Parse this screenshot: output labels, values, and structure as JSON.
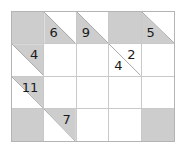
{
  "puzzle": {
    "type": "kakuro",
    "rows": 4,
    "cols": 5,
    "colors": {
      "clue_fill": "#cdcdcd",
      "entry_fill": "#ffffff",
      "grid_line": "#c9c9c9",
      "border": "#b4b4b4",
      "diagonal": "#a9a9a9",
      "numeral": "#1a1a1a"
    },
    "cells": [
      [
        {
          "kind": "block",
          "across": "",
          "down": ""
        },
        {
          "kind": "clue",
          "across": "",
          "down": "6"
        },
        {
          "kind": "clue",
          "across": "",
          "down": "9"
        },
        {
          "kind": "block",
          "across": "",
          "down": ""
        },
        {
          "kind": "clue",
          "across": "",
          "down": "5"
        }
      ],
      [
        {
          "kind": "clue",
          "across": "4",
          "down": ""
        },
        {
          "kind": "entry",
          "across": "",
          "down": ""
        },
        {
          "kind": "entry",
          "across": "",
          "down": ""
        },
        {
          "kind": "clue",
          "across": "2",
          "down": "4"
        },
        {
          "kind": "entry",
          "across": "",
          "down": ""
        }
      ],
      [
        {
          "kind": "clue",
          "across": "11",
          "down": ""
        },
        {
          "kind": "entry",
          "across": "",
          "down": ""
        },
        {
          "kind": "entry",
          "across": "",
          "down": ""
        },
        {
          "kind": "entry",
          "across": "",
          "down": ""
        },
        {
          "kind": "entry",
          "across": "",
          "down": ""
        }
      ],
      [
        {
          "kind": "block",
          "across": "",
          "down": ""
        },
        {
          "kind": "clue",
          "across": "7",
          "down": ""
        },
        {
          "kind": "entry",
          "across": "",
          "down": ""
        },
        {
          "kind": "entry",
          "across": "",
          "down": ""
        },
        {
          "kind": "block",
          "across": "",
          "down": ""
        }
      ]
    ]
  }
}
